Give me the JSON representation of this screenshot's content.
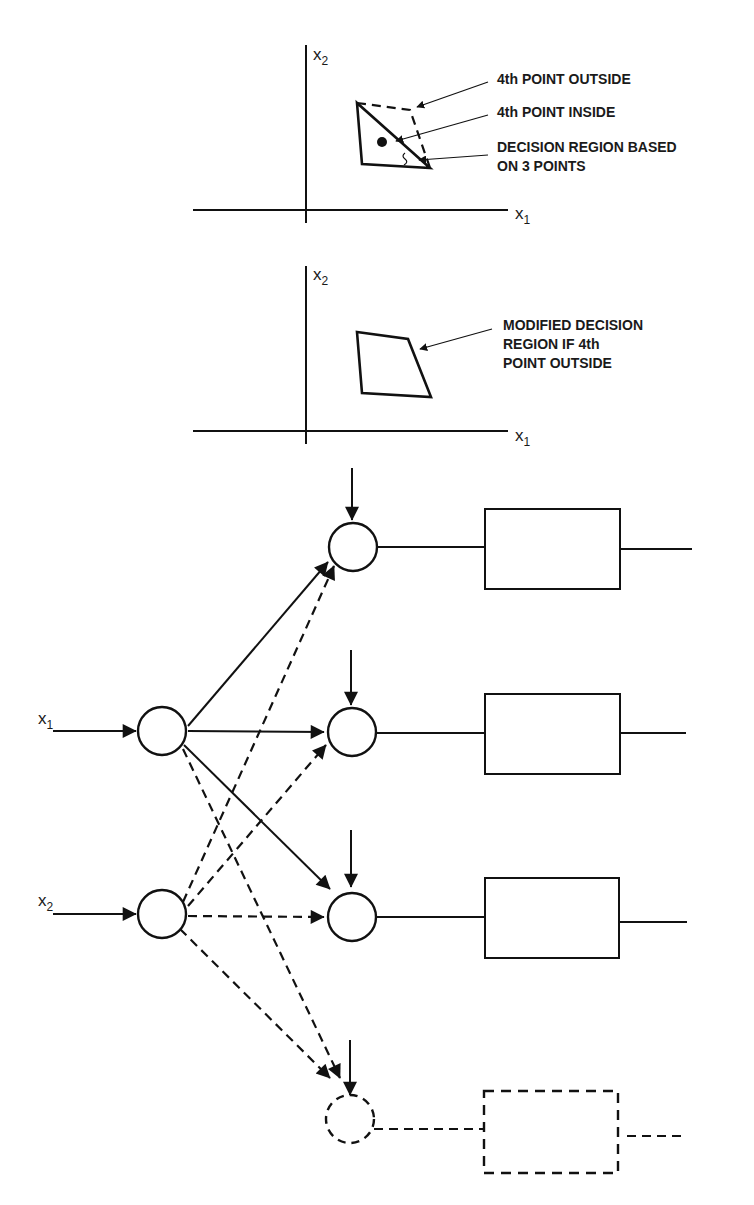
{
  "figure": {
    "top_plot": {
      "x_axis_label": "x",
      "x_axis_sub": "1",
      "y_axis_label": "x",
      "y_axis_sub": "2",
      "annotations": [
        {
          "id": "outside",
          "lines": [
            "4th POINT OUTSIDE"
          ]
        },
        {
          "id": "inside",
          "lines": [
            "4th POINT INSIDE"
          ]
        },
        {
          "id": "region",
          "lines": [
            "DECISION REGION BASED",
            "ON 3 POINTS"
          ]
        }
      ]
    },
    "middle_plot": {
      "x_axis_label": "x",
      "x_axis_sub": "1",
      "y_axis_label": "x",
      "y_axis_sub": "2",
      "annotations": [
        {
          "id": "modified",
          "lines": [
            "MODIFIED DECISION",
            "REGION IF 4th",
            "POINT OUTSIDE"
          ]
        }
      ]
    },
    "network": {
      "inputs": [
        {
          "label": "x",
          "sub": "1"
        },
        {
          "label": "x",
          "sub": "2"
        }
      ],
      "hidden_nodes": 4,
      "dashed_node_index": 3,
      "output_boxes": 4
    },
    "colors": {
      "ink": "#111111",
      "background": "#ffffff"
    }
  }
}
